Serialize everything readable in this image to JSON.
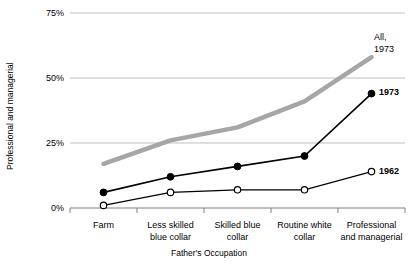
{
  "chart_data": {
    "type": "line",
    "title": "",
    "xlabel": "Father's Occupation",
    "ylabel": "Professional and managerial",
    "categories": [
      "Farm",
      "Less skilled blue collar",
      "Skilled blue collar",
      "Routine white collar",
      "Professional and managerial"
    ],
    "category_lines": [
      [
        "Farm"
      ],
      [
        "Less skilled",
        "blue collar"
      ],
      [
        "Skilled blue",
        "collar"
      ],
      [
        "Routine white",
        "collar"
      ],
      [
        "Professional",
        "and managerial"
      ]
    ],
    "ylim": [
      0,
      75
    ],
    "yticks": [
      0,
      25,
      50,
      75
    ],
    "ytick_labels": [
      "0%",
      "25%",
      "50%",
      "75%"
    ],
    "grid": true,
    "legend_position": "in-plot-right",
    "series": [
      {
        "name": "1973",
        "label": "1973",
        "marker": "filled-circle",
        "color": "#000000",
        "values": [
          6,
          12,
          16,
          20,
          44
        ]
      },
      {
        "name": "1962",
        "label": "1962",
        "marker": "open-circle",
        "color": "#000000",
        "values": [
          1,
          6,
          7,
          7,
          14
        ]
      },
      {
        "name": "All, 1973",
        "label": "All,\n1973",
        "label_lines": [
          "All,",
          "1973"
        ],
        "marker": "none",
        "color": "#a6a6a6",
        "values": [
          17,
          26,
          31,
          41,
          58
        ]
      }
    ]
  },
  "colors": {
    "grid": "#bfbfbf",
    "axis": "#808080",
    "series_black": "#000000",
    "series_gray": "#a6a6a6",
    "text": "#000000",
    "background": "#ffffff"
  }
}
